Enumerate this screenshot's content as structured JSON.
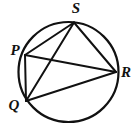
{
  "figure": {
    "name": "circle-with-inscribed-quadrilateral",
    "background_color": "#ffffff",
    "stroke_color": "#111111",
    "label_color": "#111111"
  },
  "chart_data": {
    "type": "diagram",
    "xlabel": "",
    "ylabel": "",
    "circle": {
      "name": "circumscribed-circle",
      "center_x": 68.5,
      "center_y": 72,
      "radius": 50,
      "stroke_width": 2.2,
      "fill": "none"
    },
    "points": [
      {
        "id": "S",
        "label": "S",
        "x": 74,
        "y": 22.5,
        "label_x": 76,
        "label_y": 13,
        "anchor": "middle"
      },
      {
        "id": "P",
        "label": "P",
        "x": 25,
        "y": 55,
        "label_x": 15,
        "label_y": 55,
        "anchor": "middle"
      },
      {
        "id": "R",
        "label": "R",
        "x": 116,
        "y": 72,
        "label_x": 126,
        "label_y": 77,
        "anchor": "middle"
      },
      {
        "id": "Q",
        "label": "Q",
        "x": 26,
        "y": 101,
        "label_x": 14,
        "label_y": 110,
        "anchor": "middle"
      }
    ],
    "chords": [
      {
        "id": "PS",
        "from": "P",
        "to": "S",
        "x1": 25,
        "y1": 55,
        "x2": 74,
        "y2": 22.5
      },
      {
        "id": "PR",
        "from": "P",
        "to": "R",
        "x1": 25,
        "y1": 55,
        "x2": 116,
        "y2": 72
      },
      {
        "id": "PQ",
        "from": "P",
        "to": "Q",
        "x1": 25,
        "y1": 55,
        "x2": 26,
        "y2": 101
      },
      {
        "id": "QS",
        "from": "Q",
        "to": "S",
        "x1": 26,
        "y1": 101,
        "x2": 74,
        "y2": 22.5
      },
      {
        "id": "QR",
        "from": "Q",
        "to": "R",
        "x1": 26,
        "y1": 101,
        "x2": 116,
        "y2": 72
      },
      {
        "id": "SR",
        "from": "S",
        "to": "R",
        "x1": 74,
        "y1": 22.5,
        "x2": 116,
        "y2": 72
      }
    ],
    "legend": [],
    "annotations": [
      "P",
      "Q",
      "R",
      "S"
    ]
  }
}
